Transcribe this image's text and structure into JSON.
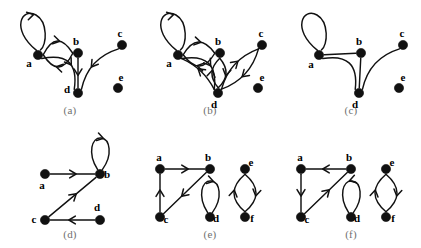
{
  "figure": {
    "type": "graph-diagram-grid",
    "width": 421,
    "height": 248,
    "background": "#ffffff",
    "ink_color": "#111111",
    "caption_color": "#6f6f6f",
    "node_radius": 4.6,
    "rows": 2,
    "cols": 3
  },
  "panels": [
    {
      "id": "a",
      "caption": "(a)",
      "kind": "directed",
      "origin": {
        "x": 0,
        "y": 0
      },
      "vertices": [
        {
          "name": "a",
          "x": 38,
          "y": 55,
          "label": "a",
          "label_dx": -9,
          "label_dy": 12
        },
        {
          "name": "b",
          "x": 78,
          "y": 53,
          "label": "b",
          "label_dx": -2,
          "label_dy": -8
        },
        {
          "name": "c",
          "x": 122,
          "y": 45,
          "label": "c",
          "label_dx": -2,
          "label_dy": -8
        },
        {
          "name": "d",
          "x": 78,
          "y": 93,
          "label": "d",
          "label_dx": -11,
          "label_dy": 0
        },
        {
          "name": "e",
          "x": 118,
          "y": 88,
          "label": "e",
          "label_dx": 3,
          "label_dy": -7
        }
      ],
      "edges": [
        {
          "from": "a",
          "to": "a",
          "kind": "self-loop",
          "loop_dir": "up-left",
          "arrow": true
        },
        {
          "from": "a",
          "to": "b",
          "kind": "arc",
          "bow": -13,
          "arrow": true
        },
        {
          "from": "b",
          "to": "a",
          "kind": "arc",
          "bow": -13,
          "arrow": true
        },
        {
          "from": "a",
          "to": "d",
          "kind": "arc",
          "bow": -16,
          "arrow": true
        },
        {
          "from": "b",
          "to": "d",
          "kind": "straight",
          "arrow": true
        },
        {
          "from": "c",
          "to": "d",
          "kind": "arc",
          "bow": 8,
          "arrow": true
        }
      ]
    },
    {
      "id": "b",
      "caption": "(b)",
      "kind": "directed",
      "origin": {
        "x": 140,
        "y": 0
      },
      "vertices": [
        {
          "name": "a",
          "x": 38,
          "y": 55,
          "label": "a",
          "label_dx": -9,
          "label_dy": 12
        },
        {
          "name": "b",
          "x": 80,
          "y": 53,
          "label": "b",
          "label_dx": -2,
          "label_dy": -8
        },
        {
          "name": "c",
          "x": 122,
          "y": 45,
          "label": "c",
          "label_dx": -1,
          "label_dy": -8
        },
        {
          "name": "d",
          "x": 78,
          "y": 93,
          "label": "d",
          "label_dx": -4,
          "label_dy": 15
        },
        {
          "name": "e",
          "x": 118,
          "y": 88,
          "label": "e",
          "label_dx": 4,
          "label_dy": -7
        }
      ],
      "edges": [
        {
          "from": "a",
          "to": "a",
          "kind": "self-loop",
          "loop_dir": "up-left",
          "arrow": true
        },
        {
          "from": "a",
          "to": "b",
          "kind": "arc",
          "bow": -12,
          "arrow": true
        },
        {
          "from": "b",
          "to": "a",
          "kind": "arc",
          "bow": -12,
          "arrow": true
        },
        {
          "from": "a",
          "to": "d",
          "kind": "arc",
          "bow": -15,
          "arrow": true
        },
        {
          "from": "d",
          "to": "a",
          "kind": "arc",
          "bow": 4,
          "arrow": true
        },
        {
          "from": "b",
          "to": "d",
          "kind": "arc",
          "bow": -7,
          "arrow": true
        },
        {
          "from": "d",
          "to": "b",
          "kind": "arc",
          "bow": -7,
          "arrow": true
        },
        {
          "from": "d",
          "to": "c",
          "kind": "arc",
          "bow": -7,
          "arrow": true
        },
        {
          "from": "c",
          "to": "d",
          "kind": "arc",
          "bow": -7,
          "arrow": true
        }
      ]
    },
    {
      "id": "c",
      "caption": "(c)",
      "kind": "undirected",
      "origin": {
        "x": 281,
        "y": 0
      },
      "vertices": [
        {
          "name": "a",
          "x": 38,
          "y": 55,
          "label": "a",
          "label_dx": -8,
          "label_dy": 13
        },
        {
          "name": "b",
          "x": 80,
          "y": 53,
          "label": "b",
          "label_dx": -2,
          "label_dy": -8
        },
        {
          "name": "c",
          "x": 122,
          "y": 45,
          "label": "c",
          "label_dx": -1,
          "label_dy": -8
        },
        {
          "name": "d",
          "x": 78,
          "y": 93,
          "label": "d",
          "label_dx": -4,
          "label_dy": 15
        },
        {
          "name": "e",
          "x": 118,
          "y": 88,
          "label": "e",
          "label_dx": 4,
          "label_dy": -7
        }
      ],
      "edges": [
        {
          "from": "a",
          "to": "a",
          "kind": "self-loop",
          "loop_dir": "up-left",
          "arrow": false
        },
        {
          "from": "a",
          "to": "b",
          "kind": "straight",
          "arrow": false
        },
        {
          "from": "a",
          "to": "d",
          "kind": "arc",
          "bow": -15,
          "arrow": false
        },
        {
          "from": "b",
          "to": "d",
          "kind": "straight",
          "arrow": false
        },
        {
          "from": "c",
          "to": "d",
          "kind": "arc",
          "bow": 8,
          "arrow": false
        }
      ]
    },
    {
      "id": "d",
      "caption": "(d)",
      "kind": "directed",
      "origin": {
        "x": 0,
        "y": 124
      },
      "vertices": [
        {
          "name": "a",
          "x": 45,
          "y": 50,
          "label": "a",
          "label_dx": -3,
          "label_dy": 15
        },
        {
          "name": "b",
          "x": 100,
          "y": 50,
          "label": "b",
          "label_dx": 7,
          "label_dy": 4
        },
        {
          "name": "c",
          "x": 45,
          "y": 96,
          "label": "c",
          "label_dx": -11,
          "label_dy": 3
        },
        {
          "name": "d",
          "x": 100,
          "y": 96,
          "label": "d",
          "label_dx": -3,
          "label_dy": -9
        }
      ],
      "edges": [
        {
          "from": "a",
          "to": "b",
          "kind": "straight",
          "arrow": true
        },
        {
          "from": "b",
          "to": "b",
          "kind": "self-loop",
          "loop_dir": "up",
          "arrow": true
        },
        {
          "from": "c",
          "to": "b",
          "kind": "straight",
          "arrow": true
        },
        {
          "from": "d",
          "to": "c",
          "kind": "straight",
          "arrow": true
        }
      ]
    },
    {
      "id": "e",
      "caption": "(e)",
      "kind": "directed",
      "origin": {
        "x": 140,
        "y": 124
      },
      "vertices": [
        {
          "name": "a",
          "x": 20,
          "y": 45,
          "label": "a",
          "label_dx": -1,
          "label_dy": -8
        },
        {
          "name": "b",
          "x": 70,
          "y": 45,
          "label": "b",
          "label_dx": -2,
          "label_dy": -8
        },
        {
          "name": "c",
          "x": 20,
          "y": 93,
          "label": "c",
          "label_dx": 6,
          "label_dy": 6
        },
        {
          "name": "d",
          "x": 70,
          "y": 93,
          "label": "d",
          "label_dx": 6,
          "label_dy": 5
        },
        {
          "name": "e",
          "x": 105,
          "y": 45,
          "label": "e",
          "label_dx": 6,
          "label_dy": -3
        },
        {
          "name": "f",
          "x": 105,
          "y": 93,
          "label": "f",
          "label_dx": 7,
          "label_dy": 5
        }
      ],
      "edges": [
        {
          "from": "a",
          "to": "b",
          "kind": "straight",
          "arrow": true
        },
        {
          "from": "b",
          "to": "c",
          "kind": "straight",
          "arrow": true
        },
        {
          "from": "c",
          "to": "a",
          "kind": "straight",
          "arrow": true
        },
        {
          "from": "d",
          "to": "d",
          "kind": "self-loop",
          "loop_dir": "up",
          "arrow": true,
          "spin": "cw"
        },
        {
          "from": "e",
          "to": "f",
          "kind": "arc",
          "bow": -11,
          "arrow": true
        },
        {
          "from": "f",
          "to": "e",
          "kind": "arc",
          "bow": -11,
          "arrow": true
        }
      ]
    },
    {
      "id": "f",
      "caption": "(f)",
      "kind": "directed",
      "origin": {
        "x": 281,
        "y": 124
      },
      "vertices": [
        {
          "name": "a",
          "x": 20,
          "y": 45,
          "label": "a",
          "label_dx": -1,
          "label_dy": -8
        },
        {
          "name": "b",
          "x": 70,
          "y": 45,
          "label": "b",
          "label_dx": -2,
          "label_dy": -8
        },
        {
          "name": "c",
          "x": 20,
          "y": 93,
          "label": "c",
          "label_dx": 6,
          "label_dy": 6
        },
        {
          "name": "d",
          "x": 70,
          "y": 93,
          "label": "d",
          "label_dx": 6,
          "label_dy": 5
        },
        {
          "name": "e",
          "x": 105,
          "y": 45,
          "label": "e",
          "label_dx": 6,
          "label_dy": -3
        },
        {
          "name": "f",
          "x": 105,
          "y": 93,
          "label": "f",
          "label_dx": 7,
          "label_dy": 5
        }
      ],
      "edges": [
        {
          "from": "b",
          "to": "a",
          "kind": "straight",
          "arrow": true
        },
        {
          "from": "c",
          "to": "b",
          "kind": "straight",
          "arrow": true
        },
        {
          "from": "a",
          "to": "c",
          "kind": "straight",
          "arrow": true
        },
        {
          "from": "d",
          "to": "d",
          "kind": "self-loop",
          "loop_dir": "up",
          "arrow": true,
          "spin": "ccw"
        },
        {
          "from": "e",
          "to": "f",
          "kind": "arc",
          "bow": -11,
          "arrow": true
        },
        {
          "from": "f",
          "to": "e",
          "kind": "arc",
          "bow": -11,
          "arrow": true
        }
      ]
    }
  ],
  "captions": {
    "a": "(a)",
    "b": "(b)",
    "c": "(c)",
    "d": "(d)",
    "e": "(e)",
    "f": "(f)"
  }
}
